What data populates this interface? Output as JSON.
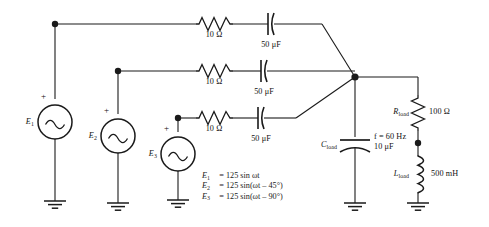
{
  "sources": [
    {
      "id": "E1",
      "label": "E",
      "sub": "1",
      "polarity": "+"
    },
    {
      "id": "E2",
      "label": "E",
      "sub": "2",
      "polarity": "+"
    },
    {
      "id": "E3",
      "label": "E",
      "sub": "3",
      "polarity": "+"
    }
  ],
  "branches": [
    {
      "resistor": "10 Ω",
      "capacitor": "50 μF"
    },
    {
      "resistor": "10 Ω",
      "capacitor": "50 μF"
    },
    {
      "resistor": "10 Ω",
      "capacitor": "50 μF"
    }
  ],
  "load": {
    "capacitor_label": "C",
    "capacitor_sub": "load",
    "capacitor_value": "10 μF",
    "frequency": "f = 60 Hz",
    "frequency_italic": "f",
    "frequency_rest": " = 60 Hz",
    "resistor_label": "R",
    "resistor_sub": "load",
    "resistor_value": "100 Ω",
    "inductor_label": "L",
    "inductor_sub": "load",
    "inductor_value": "500 mH"
  },
  "equations": [
    {
      "lhs": "E",
      "lhs_sub": "1",
      "eq": "=",
      "rhs": "125 sin ωt"
    },
    {
      "lhs": "E",
      "lhs_sub": "2",
      "eq": "=",
      "rhs": "125 sin(ωt – 45°)"
    },
    {
      "lhs": "E",
      "lhs_sub": "3",
      "eq": "=",
      "rhs": "125 sin(ωt – 90°)"
    }
  ],
  "colors": {
    "wire": "#1a1a1a",
    "background": "#ffffff",
    "text": "#111111"
  },
  "ground_count": 5
}
